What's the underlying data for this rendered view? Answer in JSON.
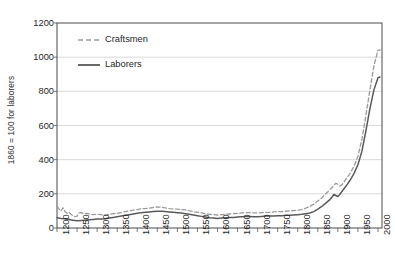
{
  "chart_data": {
    "type": "line",
    "title": "",
    "xlabel": "",
    "ylabel": "1860 = 100 for laborers",
    "xlim": [
      1200,
      2010
    ],
    "ylim": [
      0,
      1200
    ],
    "grid": "horizontal",
    "legend_position": "upper-left-inside",
    "xticks": [
      "1200",
      "1250",
      "1300",
      "1350",
      "1400",
      "1450",
      "1500",
      "1550",
      "1600",
      "1650",
      "1700",
      "1750",
      "1800",
      "1850",
      "1900",
      "1950",
      "2000"
    ],
    "yticks": [
      "0",
      "200",
      "400",
      "600",
      "800",
      "1000",
      "1200"
    ],
    "series": [
      {
        "name": "Craftsmen",
        "style": "dashed",
        "color": "#9a9a9a",
        "points": [
          [
            1200,
            128
          ],
          [
            1205,
            112
          ],
          [
            1210,
            100
          ],
          [
            1215,
            118
          ],
          [
            1220,
            96
          ],
          [
            1225,
            86
          ],
          [
            1230,
            92
          ],
          [
            1235,
            80
          ],
          [
            1240,
            72
          ],
          [
            1245,
            66
          ],
          [
            1250,
            70
          ],
          [
            1255,
            88
          ],
          [
            1260,
            90
          ],
          [
            1265,
            86
          ],
          [
            1270,
            84
          ],
          [
            1275,
            86
          ],
          [
            1280,
            82
          ],
          [
            1285,
            80
          ],
          [
            1290,
            78
          ],
          [
            1295,
            80
          ],
          [
            1300,
            80
          ],
          [
            1310,
            78
          ],
          [
            1320,
            76
          ],
          [
            1330,
            80
          ],
          [
            1340,
            84
          ],
          [
            1350,
            86
          ],
          [
            1360,
            90
          ],
          [
            1370,
            96
          ],
          [
            1380,
            100
          ],
          [
            1390,
            104
          ],
          [
            1400,
            108
          ],
          [
            1410,
            112
          ],
          [
            1420,
            114
          ],
          [
            1430,
            116
          ],
          [
            1440,
            120
          ],
          [
            1450,
            124
          ],
          [
            1460,
            122
          ],
          [
            1470,
            118
          ],
          [
            1480,
            114
          ],
          [
            1490,
            112
          ],
          [
            1500,
            110
          ],
          [
            1510,
            108
          ],
          [
            1520,
            106
          ],
          [
            1530,
            100
          ],
          [
            1540,
            96
          ],
          [
            1550,
            92
          ],
          [
            1560,
            88
          ],
          [
            1570,
            84
          ],
          [
            1580,
            80
          ],
          [
            1590,
            78
          ],
          [
            1600,
            76
          ],
          [
            1610,
            78
          ],
          [
            1620,
            80
          ],
          [
            1630,
            82
          ],
          [
            1640,
            84
          ],
          [
            1650,
            86
          ],
          [
            1660,
            88
          ],
          [
            1670,
            90
          ],
          [
            1680,
            90
          ],
          [
            1690,
            88
          ],
          [
            1700,
            88
          ],
          [
            1710,
            90
          ],
          [
            1720,
            92
          ],
          [
            1730,
            92
          ],
          [
            1740,
            94
          ],
          [
            1750,
            96
          ],
          [
            1760,
            96
          ],
          [
            1770,
            98
          ],
          [
            1780,
            100
          ],
          [
            1790,
            102
          ],
          [
            1800,
            104
          ],
          [
            1810,
            108
          ],
          [
            1820,
            116
          ],
          [
            1830,
            126
          ],
          [
            1840,
            140
          ],
          [
            1850,
            158
          ],
          [
            1860,
            176
          ],
          [
            1870,
            200
          ],
          [
            1880,
            224
          ],
          [
            1890,
            248
          ],
          [
            1895,
            262
          ],
          [
            1900,
            256
          ],
          [
            1905,
            246
          ],
          [
            1910,
            252
          ],
          [
            1915,
            268
          ],
          [
            1920,
            286
          ],
          [
            1930,
            318
          ],
          [
            1940,
            360
          ],
          [
            1950,
            420
          ],
          [
            1960,
            520
          ],
          [
            1970,
            660
          ],
          [
            1980,
            810
          ],
          [
            1990,
            950
          ],
          [
            2000,
            1040
          ],
          [
            2005,
            1042
          ]
        ]
      },
      {
        "name": "Laborers",
        "style": "solid",
        "color": "#595959",
        "points": [
          [
            1200,
            60
          ],
          [
            1210,
            56
          ],
          [
            1220,
            54
          ],
          [
            1230,
            50
          ],
          [
            1240,
            46
          ],
          [
            1250,
            42
          ],
          [
            1260,
            44
          ],
          [
            1270,
            46
          ],
          [
            1280,
            48
          ],
          [
            1290,
            50
          ],
          [
            1300,
            52
          ],
          [
            1310,
            52
          ],
          [
            1320,
            54
          ],
          [
            1330,
            58
          ],
          [
            1340,
            62
          ],
          [
            1350,
            66
          ],
          [
            1360,
            70
          ],
          [
            1370,
            74
          ],
          [
            1380,
            78
          ],
          [
            1390,
            82
          ],
          [
            1400,
            86
          ],
          [
            1410,
            90
          ],
          [
            1420,
            92
          ],
          [
            1430,
            94
          ],
          [
            1440,
            96
          ],
          [
            1450,
            98
          ],
          [
            1460,
            98
          ],
          [
            1470,
            96
          ],
          [
            1480,
            94
          ],
          [
            1490,
            92
          ],
          [
            1500,
            90
          ],
          [
            1510,
            88
          ],
          [
            1520,
            84
          ],
          [
            1530,
            80
          ],
          [
            1540,
            76
          ],
          [
            1550,
            72
          ],
          [
            1560,
            68
          ],
          [
            1570,
            64
          ],
          [
            1580,
            60
          ],
          [
            1590,
            58
          ],
          [
            1600,
            56
          ],
          [
            1610,
            58
          ],
          [
            1620,
            60
          ],
          [
            1630,
            62
          ],
          [
            1640,
            62
          ],
          [
            1650,
            64
          ],
          [
            1660,
            66
          ],
          [
            1670,
            68
          ],
          [
            1680,
            68
          ],
          [
            1690,
            66
          ],
          [
            1700,
            66
          ],
          [
            1710,
            68
          ],
          [
            1720,
            70
          ],
          [
            1730,
            70
          ],
          [
            1740,
            70
          ],
          [
            1750,
            72
          ],
          [
            1760,
            72
          ],
          [
            1770,
            74
          ],
          [
            1780,
            74
          ],
          [
            1790,
            76
          ],
          [
            1800,
            78
          ],
          [
            1810,
            80
          ],
          [
            1820,
            84
          ],
          [
            1830,
            88
          ],
          [
            1840,
            96
          ],
          [
            1850,
            110
          ],
          [
            1860,
            126
          ],
          [
            1870,
            146
          ],
          [
            1880,
            166
          ],
          [
            1885,
            180
          ],
          [
            1890,
            196
          ],
          [
            1895,
            190
          ],
          [
            1900,
            184
          ],
          [
            1905,
            196
          ],
          [
            1910,
            214
          ],
          [
            1920,
            244
          ],
          [
            1930,
            278
          ],
          [
            1940,
            318
          ],
          [
            1950,
            370
          ],
          [
            1960,
            450
          ],
          [
            1970,
            570
          ],
          [
            1980,
            700
          ],
          [
            1990,
            810
          ],
          [
            2000,
            880
          ],
          [
            2005,
            884
          ]
        ]
      }
    ],
    "legend": [
      {
        "label": "Craftsmen",
        "style": "dashed",
        "color": "#9a9a9a"
      },
      {
        "label": "Laborers",
        "style": "solid",
        "color": "#595959"
      }
    ]
  }
}
